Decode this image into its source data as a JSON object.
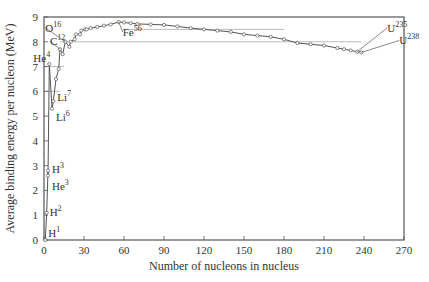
{
  "chart_data": {
    "type": "line",
    "title": "",
    "xlabel": "Number of nucleons in nucleus",
    "ylabel": "Average binding energy per nucleon (MeV)",
    "xlim": [
      0,
      270
    ],
    "ylim": [
      0,
      9
    ],
    "xticks": [
      0,
      30,
      60,
      90,
      120,
      150,
      180,
      210,
      240,
      270
    ],
    "yticks": [
      0,
      1,
      2,
      3,
      4,
      5,
      6,
      7,
      8,
      9
    ],
    "grid": false,
    "reference_lines": [
      {
        "y": 8.5,
        "x_from": 60,
        "x_to": 180
      },
      {
        "y": 8.0,
        "x_from": 12,
        "x_to": 238
      },
      {
        "y": 7.0,
        "x_from": 0,
        "x_to": 15
      },
      {
        "y": 6.0,
        "x_from": 0,
        "x_to": 12
      }
    ],
    "series": [
      {
        "name": "Binding energy per nucleon",
        "x": [
          1,
          2,
          3,
          3,
          4,
          6,
          7,
          9,
          11,
          12,
          14,
          16,
          19,
          20,
          23,
          24,
          27,
          28,
          31,
          32,
          35,
          40,
          45,
          50,
          56,
          60,
          65,
          70,
          80,
          90,
          100,
          110,
          120,
          130,
          140,
          150,
          160,
          170,
          180,
          190,
          200,
          210,
          220,
          225,
          230,
          235,
          238
        ],
        "y": [
          0.0,
          1.1,
          2.8,
          2.6,
          7.1,
          5.3,
          5.6,
          6.5,
          6.9,
          7.7,
          7.5,
          8.0,
          7.8,
          8.0,
          8.1,
          8.3,
          8.3,
          8.45,
          8.5,
          8.5,
          8.55,
          8.6,
          8.65,
          8.7,
          8.8,
          8.78,
          8.75,
          8.72,
          8.7,
          8.68,
          8.62,
          8.55,
          8.5,
          8.45,
          8.4,
          8.3,
          8.25,
          8.2,
          8.1,
          7.95,
          7.9,
          7.85,
          7.75,
          7.7,
          7.65,
          7.6,
          7.57
        ]
      }
    ],
    "annotations": [
      {
        "label": "H",
        "sup": "1",
        "x": 1,
        "y": 0.0
      },
      {
        "label": "H",
        "sup": "2",
        "x": 2,
        "y": 1.1
      },
      {
        "label": "H",
        "sup": "3",
        "x": 3,
        "y": 2.8
      },
      {
        "label": "He",
        "sup": "3",
        "x": 3,
        "y": 2.6
      },
      {
        "label": "Li",
        "sup": "6",
        "x": 6,
        "y": 5.3
      },
      {
        "label": "Li",
        "sup": "7",
        "x": 7,
        "y": 5.6
      },
      {
        "label": "He",
        "sup": "4",
        "x": 4,
        "y": 7.1
      },
      {
        "label": "C",
        "sup": "12",
        "x": 12,
        "y": 7.7
      },
      {
        "label": "O",
        "sup": "16",
        "x": 16,
        "y": 8.0
      },
      {
        "label": "Fe",
        "sup": "56",
        "x": 56,
        "y": 8.8
      },
      {
        "label": "U",
        "sup": "235",
        "x": 235,
        "y": 7.6
      },
      {
        "label": "U",
        "sup": "238",
        "x": 238,
        "y": 7.57
      }
    ]
  },
  "layout": {
    "plot_left": 44,
    "plot_right": 404,
    "plot_top": 17,
    "plot_bottom": 240,
    "axis_color": "#555555",
    "line_color": "#555555",
    "ref_line_color": "#aaaaaa"
  }
}
